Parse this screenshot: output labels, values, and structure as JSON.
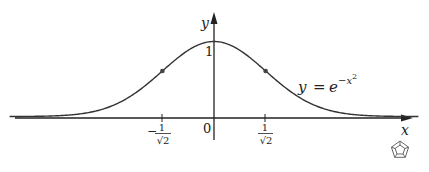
{
  "figure": {
    "equation": {
      "lhs": "y",
      "eq": "=",
      "base": "e",
      "exponent": "−x",
      "exponent_power": "2"
    },
    "axes": {
      "x_label": "x",
      "y_label": "y"
    },
    "ticks": {
      "origin": "0",
      "y_one": "1",
      "neg": {
        "sign": "−",
        "num": "1",
        "den": "√2"
      },
      "pos": {
        "num": "1",
        "den": "√2"
      }
    },
    "colors": {
      "curve": "#333333",
      "axis": "#222222",
      "dot": "#444444"
    }
  },
  "chart_data": {
    "type": "line",
    "title": "",
    "function": "y = e^(-x^2)",
    "xlabel": "x",
    "ylabel": "y",
    "x_ticks": [
      "-1/√2",
      "0",
      "1/√2"
    ],
    "y_ticks": [
      "1"
    ],
    "grid": false,
    "legend": null,
    "annotations": [
      {
        "text": "y = e^{-x^2}",
        "position": "right of curve"
      },
      {
        "text": "inflection point",
        "x": -0.7071,
        "y": 0.6065
      },
      {
        "text": "inflection point",
        "x": 0.7071,
        "y": 0.6065
      }
    ],
    "x": [
      -2.75,
      -2.5,
      -2,
      -1.5,
      -1,
      -0.7071,
      -0.5,
      0,
      0.5,
      0.7071,
      1,
      1.5,
      2,
      2.5,
      2.75
    ],
    "values": [
      0.0005,
      0.0019,
      0.0183,
      0.1054,
      0.3679,
      0.6065,
      0.7788,
      1.0,
      0.7788,
      0.6065,
      0.3679,
      0.1054,
      0.0183,
      0.0019,
      0.0005
    ],
    "xlim": [
      -2.8,
      2.8
    ],
    "ylim": [
      0,
      1.3
    ]
  }
}
